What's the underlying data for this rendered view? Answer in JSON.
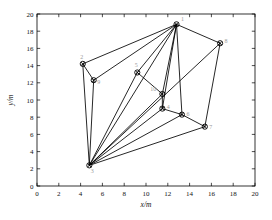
{
  "chart_data": {
    "type": "scatter",
    "title": "",
    "xlabel": "x/m",
    "ylabel": "y/m",
    "xlim": [
      0,
      20
    ],
    "ylim": [
      0,
      20
    ],
    "xticks": [
      0,
      2,
      4,
      6,
      8,
      10,
      12,
      14,
      16,
      18,
      20
    ],
    "yticks": [
      0,
      2,
      4,
      6,
      8,
      10,
      12,
      14,
      16,
      18,
      20
    ],
    "xticklabels": [
      "0",
      "2",
      "4",
      "6",
      "8",
      "10",
      "12",
      "14",
      "16",
      "18",
      "20"
    ],
    "yticklabels": [
      "0",
      "2",
      "4",
      "6",
      "8",
      "10",
      "12",
      "14",
      "16",
      "18",
      "20"
    ],
    "grid": false,
    "legend": null,
    "marker": "circle-with-cross",
    "marker_color": "#000000",
    "edge_color": "#000000",
    "nodes": [
      {
        "id": "1",
        "label": "1",
        "x": 12.8,
        "y": 18.8,
        "label_dx": 6,
        "label_dy": -3
      },
      {
        "id": "2",
        "label": "2",
        "x": 4.2,
        "y": 14.2,
        "label_dx": -1,
        "label_dy": -5
      },
      {
        "id": "3",
        "label": "3",
        "x": 4.8,
        "y": 2.4,
        "label_dx": 3,
        "label_dy": 8
      },
      {
        "id": "4",
        "label": "4",
        "x": 11.5,
        "y": 9.0,
        "label_dx": 6,
        "label_dy": 0
      },
      {
        "id": "5",
        "label": "5",
        "x": 9.2,
        "y": 13.2,
        "label_dx": -1,
        "label_dy": -5
      },
      {
        "id": "6",
        "label": "6",
        "x": 13.3,
        "y": 8.3,
        "label_dx": 6,
        "label_dy": 1
      },
      {
        "id": "7",
        "label": "7",
        "x": 15.4,
        "y": 6.9,
        "label_dx": 6,
        "label_dy": 2
      },
      {
        "id": "8",
        "label": "8",
        "x": 16.8,
        "y": 16.6,
        "label_dx": 6,
        "label_dy": 0
      },
      {
        "id": "9",
        "label": "9",
        "x": 5.2,
        "y": 12.3,
        "label_dx": 5,
        "label_dy": 4
      },
      {
        "id": "10",
        "label": "10",
        "x": 11.5,
        "y": 10.7,
        "label_dx": -9,
        "label_dy": -3
      }
    ],
    "edges": [
      [
        "1",
        "2"
      ],
      [
        "1",
        "8"
      ],
      [
        "1",
        "9"
      ],
      [
        "1",
        "5"
      ],
      [
        "1",
        "3"
      ],
      [
        "1",
        "10"
      ],
      [
        "1",
        "4"
      ],
      [
        "1",
        "6"
      ],
      [
        "2",
        "9"
      ],
      [
        "2",
        "3"
      ],
      [
        "3",
        "9"
      ],
      [
        "3",
        "5"
      ],
      [
        "3",
        "10"
      ],
      [
        "3",
        "4"
      ],
      [
        "3",
        "6"
      ],
      [
        "3",
        "7"
      ],
      [
        "5",
        "10"
      ],
      [
        "10",
        "4"
      ],
      [
        "4",
        "6"
      ],
      [
        "6",
        "7"
      ],
      [
        "7",
        "8"
      ],
      [
        "8",
        "3"
      ]
    ]
  },
  "axes": {
    "x_title": "x/m",
    "y_title": "y/m"
  }
}
